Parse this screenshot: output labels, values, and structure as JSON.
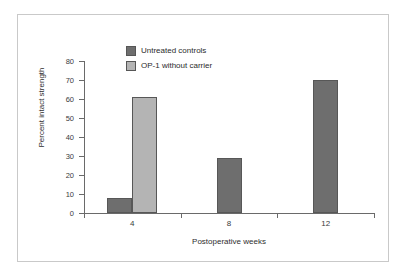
{
  "chart_data": {
    "type": "bar",
    "title": "",
    "xlabel": "Postoperative weeks",
    "ylabel": "Percent intact strength",
    "categories": [
      "4",
      "8",
      "12"
    ],
    "series": [
      {
        "name": "Untreated controls",
        "color": "#6e6e6e",
        "values": [
          8,
          29,
          70
        ]
      },
      {
        "name": "OP-1 without carrier",
        "color": "#b4b4b4",
        "values": [
          61,
          null,
          null
        ]
      }
    ],
    "ylim": [
      0,
      80
    ],
    "yticks": [
      0,
      10,
      20,
      30,
      40,
      50,
      60,
      70,
      80
    ],
    "ytick_labels": [
      "0",
      "10",
      "20",
      "30",
      "40",
      "50",
      "60",
      "70",
      "80"
    ],
    "grid": false,
    "legend_position": "top-center",
    "frame_border_color": "#c9c9c9",
    "axis_color": "#6a6a6a",
    "background": "#ffffff"
  }
}
